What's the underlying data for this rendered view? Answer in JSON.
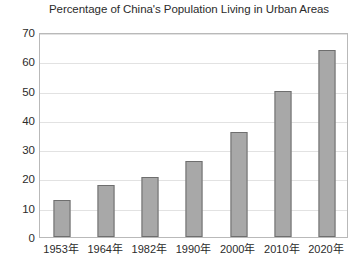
{
  "chart_data": {
    "type": "bar",
    "title": "Percentage of China's Population Living in Urban Areas",
    "xlabel": "",
    "ylabel": "",
    "categories": [
      "1953年",
      "1964年",
      "1982年",
      "1990年",
      "2000年",
      "2010年",
      "2020年"
    ],
    "values": [
      12.8,
      17.6,
      20.6,
      26.0,
      36.0,
      50.0,
      64.0
    ],
    "ylim": [
      0,
      70
    ],
    "ytick_labels": [
      "70",
      "60",
      "50",
      "40",
      "30",
      "20",
      "10",
      "0"
    ],
    "ytick_values": [
      70,
      60,
      50,
      40,
      30,
      20,
      10,
      0
    ],
    "grid": true,
    "grid_axis": "y",
    "legend": false,
    "legend_position": "none",
    "bar_fill_color": "#a8a8a8",
    "bar_border_color": "#6e6e6e",
    "plot_background_color": "#ffffff",
    "frame_color": "#b9b9b9",
    "gridline_color": "#e2e2e2",
    "text_color": "#2b2b2b"
  }
}
